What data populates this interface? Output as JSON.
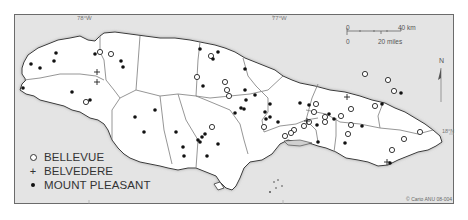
{
  "map": {
    "region": "Jamaica",
    "graticule": {
      "lon_labels": [
        "78°W",
        "77°W"
      ],
      "lat_labels": [
        "18°N"
      ]
    },
    "scale_bar": {
      "km_start": "0",
      "km_end": "40 km",
      "mi_start": "0",
      "mi_end": "20 miles"
    },
    "north_arrow": {
      "label": "N"
    },
    "credit": "© Carto ANU 08-004",
    "colors": {
      "sea": "#e4e4e4",
      "land": "#ffffff",
      "boundary": "#8a8a8a",
      "coast": "#3a3a3a",
      "symbol": "#111111"
    }
  },
  "legend": {
    "items": [
      {
        "symbol": "open-circle",
        "label": "BELLEVUE"
      },
      {
        "symbol": "plus",
        "label": "BELVEDERE"
      },
      {
        "symbol": "filled-dot",
        "label": "MOUNT PLEASANT"
      }
    ]
  },
  "points": {
    "bellevue": [
      [
        100,
        52
      ],
      [
        111,
        54
      ],
      [
        86,
        102
      ],
      [
        211,
        56
      ],
      [
        197,
        77
      ],
      [
        225,
        82
      ],
      [
        227,
        90
      ],
      [
        229,
        96
      ],
      [
        212,
        127
      ],
      [
        264,
        127
      ],
      [
        316,
        104
      ],
      [
        314,
        112
      ],
      [
        309,
        122
      ],
      [
        304,
        126
      ],
      [
        294,
        130
      ],
      [
        291,
        133
      ],
      [
        285,
        136
      ],
      [
        325,
        117
      ],
      [
        325,
        122
      ],
      [
        351,
        109
      ],
      [
        341,
        116
      ],
      [
        351,
        125
      ],
      [
        348,
        134
      ],
      [
        365,
        74
      ],
      [
        388,
        80
      ],
      [
        394,
        91
      ],
      [
        375,
        106
      ],
      [
        420,
        132
      ],
      [
        392,
        150
      ],
      [
        404,
        139
      ]
    ],
    "belvedere": [
      [
        97,
        72
      ],
      [
        97,
        82
      ],
      [
        307,
        121
      ],
      [
        347,
        97
      ],
      [
        387,
        162
      ]
    ],
    "mount_pleasant": [
      [
        56,
        53
      ],
      [
        54,
        61
      ],
      [
        31,
        64
      ],
      [
        40,
        68
      ],
      [
        23,
        88
      ],
      [
        72,
        92
      ],
      [
        95,
        54
      ],
      [
        121,
        61
      ],
      [
        123,
        67
      ],
      [
        155,
        110
      ],
      [
        135,
        117
      ],
      [
        144,
        132
      ],
      [
        90,
        100
      ],
      [
        200,
        49
      ],
      [
        218,
        52
      ],
      [
        213,
        59
      ],
      [
        245,
        69
      ],
      [
        203,
        86
      ],
      [
        245,
        90
      ],
      [
        246,
        100
      ],
      [
        255,
        95
      ],
      [
        244,
        109
      ],
      [
        235,
        113
      ],
      [
        241,
        108
      ],
      [
        198,
        140
      ],
      [
        200,
        142
      ],
      [
        176,
        132
      ],
      [
        183,
        147
      ],
      [
        184,
        156
      ],
      [
        207,
        156
      ],
      [
        218,
        144
      ],
      [
        202,
        137
      ],
      [
        265,
        112
      ],
      [
        266,
        119
      ],
      [
        270,
        117
      ],
      [
        278,
        122
      ],
      [
        270,
        104
      ],
      [
        309,
        105
      ],
      [
        317,
        125
      ],
      [
        334,
        119
      ],
      [
        329,
        114
      ],
      [
        300,
        103
      ],
      [
        345,
        143
      ],
      [
        362,
        126
      ],
      [
        382,
        104
      ],
      [
        401,
        93
      ],
      [
        390,
        163
      ],
      [
        205,
        134
      ],
      [
        318,
        142
      ]
    ]
  }
}
